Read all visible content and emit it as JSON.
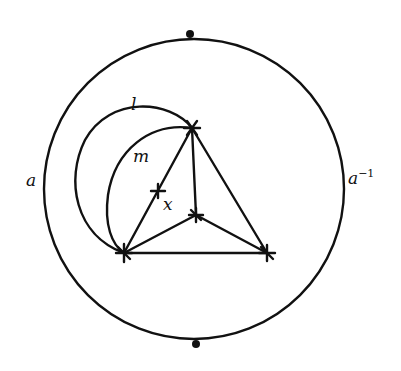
{
  "diagram": {
    "type": "topological-surface-diagram",
    "labels": {
      "left_edge": "a",
      "right_edge_base": "a",
      "right_edge_exp": "−1",
      "outer_arc": "l",
      "inner_arc": "m",
      "point": "x"
    },
    "outer_circle": {
      "cx": 194,
      "cy": 189,
      "r": 150
    },
    "boundary_points": [
      {
        "name": "top",
        "x": 190,
        "y": 34
      },
      {
        "name": "bottom",
        "x": 196,
        "y": 344
      }
    ],
    "vertices": [
      {
        "name": "top",
        "x": 192,
        "y": 128
      },
      {
        "name": "center",
        "x": 196,
        "y": 215
      },
      {
        "name": "bottom-left",
        "x": 124,
        "y": 253
      },
      {
        "name": "bottom-right",
        "x": 267,
        "y": 253
      },
      {
        "name": "x-point",
        "x": 158,
        "y": 191
      }
    ],
    "colors": {
      "stroke": "#111111",
      "background": "#ffffff"
    }
  }
}
